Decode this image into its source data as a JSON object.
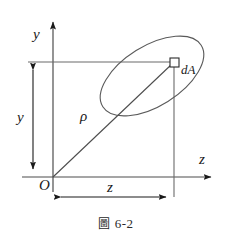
{
  "figure": {
    "caption": "圖 6-2",
    "caption_cjk": "圖",
    "caption_number": "6-2",
    "background_color": "#ffffff",
    "line_color": "#4d4d4d",
    "dark_line_color": "#1a1a1a",
    "text_color": "#1a1a1a"
  },
  "labels": {
    "axis_y": "y",
    "axis_z": "z",
    "origin": "O",
    "dimension_y": "y",
    "dimension_z": "z",
    "radius": "ρ",
    "area_element": "dA"
  },
  "geometry": {
    "origin": {
      "x": 53,
      "y": 177
    },
    "point_dA": {
      "x": 174,
      "y": 62
    },
    "y_axis": {
      "x": 53,
      "y_top": 18,
      "y_bottom": 192
    },
    "z_axis": {
      "y": 177,
      "x_left": 22,
      "x_right": 215
    },
    "projection_line_horizontal": {
      "y": 62,
      "x_from": 28,
      "x_to": 174
    },
    "projection_line_vertical": {
      "x": 174,
      "y_from": 62,
      "y_to": 197
    },
    "dimension_y_line": {
      "x": 33,
      "y_top": 62,
      "y_bottom": 177
    },
    "dimension_z_line": {
      "y": 197,
      "x_left": 53,
      "x_right": 174
    },
    "ellipse": {
      "cx": 152,
      "cy": 76,
      "rx": 58,
      "ry": 30,
      "rotation_deg": -32
    },
    "area_square": {
      "x": 170,
      "y": 58,
      "size": 9
    }
  }
}
